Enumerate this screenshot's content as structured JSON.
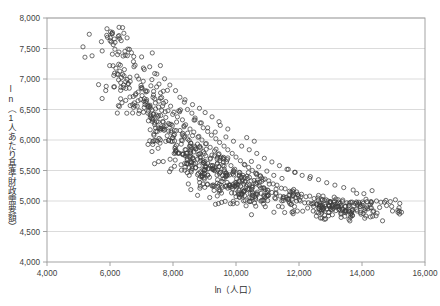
{
  "chart_data": {
    "type": "scatter",
    "title": "",
    "subtitle": "",
    "xlabel": "ln（人口）",
    "ylabel": "ln（1人あたり基準財政需要額）",
    "xlim": [
      4000,
      16000
    ],
    "ylim": [
      4000,
      8000
    ],
    "xticks": [
      4000,
      6000,
      8000,
      10000,
      12000,
      14000,
      16000
    ],
    "yticks": [
      4000,
      4500,
      5000,
      5500,
      6000,
      6500,
      7000,
      7500,
      8000
    ],
    "xtick_labels": [
      "4,000",
      "6,000",
      "8,000",
      "10,000",
      "12,000",
      "14,000",
      "16,000"
    ],
    "ytick_labels": [
      "4,000",
      "4,500",
      "5,000",
      "5,500",
      "6,000",
      "6,500",
      "7,000",
      "7,500",
      "8,000"
    ],
    "grid": "horizontal",
    "legend": "none",
    "marker": {
      "shape": "circle-open",
      "size_px": 4.2,
      "stroke": "#3d3d3d",
      "stroke_width": 0.75,
      "fill": "none"
    },
    "frame_color": "#9a9a9a",
    "grid_color": "#d7d7d7",
    "background": "#ffffff",
    "point_count": 912,
    "relationship": "negative, convex (steep decline then flattening)",
    "annotations": [],
    "points": [
      [
        5430,
        7380
      ],
      [
        6070,
        7740
      ],
      [
        6440,
        7750
      ],
      [
        6240,
        7400
      ],
      [
        5990,
        7220
      ],
      [
        6340,
        6940
      ],
      [
        5880,
        6880
      ],
      [
        6120,
        6870
      ],
      [
        6430,
        6900
      ],
      [
        6640,
        6960
      ],
      [
        5750,
        6680
      ],
      [
        6380,
        6610
      ],
      [
        6720,
        6580
      ],
      [
        6910,
        7000
      ],
      [
        7060,
        7180
      ],
      [
        7260,
        7200
      ],
      [
        7010,
        6860
      ],
      [
        7180,
        6800
      ],
      [
        6820,
        6760
      ],
      [
        7420,
        7090
      ],
      [
        7600,
        7220
      ],
      [
        7330,
        6990
      ],
      [
        7480,
        6870
      ],
      [
        7690,
        6800
      ],
      [
        7120,
        6620
      ],
      [
        7270,
        6570
      ],
      [
        7540,
        6540
      ],
      [
        7770,
        6630
      ],
      [
        7900,
        6900
      ],
      [
        8080,
        6810
      ],
      [
        7840,
        6480
      ],
      [
        7990,
        6420
      ],
      [
        8220,
        6700
      ],
      [
        8360,
        6620
      ],
      [
        8140,
        6380
      ],
      [
        8300,
        6330
      ],
      [
        8460,
        6500
      ],
      [
        8600,
        6440
      ],
      [
        8400,
        6250
      ],
      [
        8540,
        6180
      ],
      [
        8700,
        6330
      ],
      [
        8860,
        6280
      ],
      [
        8660,
        6130
      ],
      [
        8820,
        6060
      ],
      [
        8960,
        6200
      ],
      [
        9100,
        6140
      ],
      [
        8920,
        6000
      ],
      [
        9060,
        5940
      ],
      [
        9220,
        6080
      ],
      [
        9360,
        6020
      ],
      [
        9180,
        5880
      ],
      [
        9320,
        5820
      ],
      [
        9480,
        5960
      ],
      [
        9620,
        5900
      ],
      [
        9440,
        5760
      ],
      [
        9580,
        5700
      ],
      [
        9740,
        5840
      ],
      [
        9880,
        5780
      ],
      [
        9700,
        5640
      ],
      [
        9840,
        5580
      ],
      [
        10000,
        5720
      ],
      [
        10140,
        5660
      ],
      [
        9960,
        5520
      ],
      [
        10100,
        5470
      ],
      [
        10260,
        5600
      ],
      [
        10400,
        5550
      ],
      [
        10220,
        5420
      ],
      [
        10360,
        5370
      ],
      [
        10520,
        5500
      ],
      [
        10660,
        5450
      ],
      [
        10480,
        5330
      ],
      [
        10620,
        5290
      ],
      [
        10780,
        5410
      ],
      [
        10920,
        5360
      ],
      [
        10740,
        5250
      ],
      [
        10880,
        5210
      ],
      [
        11040,
        5330
      ],
      [
        11180,
        5280
      ],
      [
        11000,
        5180
      ],
      [
        11140,
        5140
      ],
      [
        11300,
        5260
      ],
      [
        11440,
        5210
      ],
      [
        11260,
        5120
      ],
      [
        11400,
        5080
      ],
      [
        11560,
        5200
      ],
      [
        11700,
        5160
      ],
      [
        11520,
        5070
      ],
      [
        11660,
        5030
      ],
      [
        11820,
        5150
      ],
      [
        11960,
        5110
      ],
      [
        11780,
        5030
      ],
      [
        11920,
        5000
      ],
      [
        12080,
        5110
      ],
      [
        12220,
        5070
      ],
      [
        12040,
        5000
      ],
      [
        12180,
        4970
      ],
      [
        12340,
        5080
      ],
      [
        12480,
        5040
      ],
      [
        12300,
        4970
      ],
      [
        12440,
        4950
      ],
      [
        12600,
        5050
      ],
      [
        12740,
        5010
      ],
      [
        12560,
        4950
      ],
      [
        12700,
        4930
      ],
      [
        12860,
        5020
      ],
      [
        13000,
        4990
      ],
      [
        12820,
        4940
      ],
      [
        12960,
        4920
      ],
      [
        13120,
        5000
      ],
      [
        13260,
        4980
      ],
      [
        13080,
        4930
      ],
      [
        13220,
        4910
      ],
      [
        13380,
        4990
      ],
      [
        13520,
        4970
      ],
      [
        13340,
        4930
      ],
      [
        13480,
        4910
      ],
      [
        13640,
        4980
      ],
      [
        13780,
        4960
      ],
      [
        13600,
        4930
      ],
      [
        13740,
        4920
      ],
      [
        13900,
        4980
      ],
      [
        14040,
        4960
      ],
      [
        13860,
        4940
      ],
      [
        14000,
        4930
      ],
      [
        14160,
        4990
      ],
      [
        14300,
        4970
      ],
      [
        14460,
        5000
      ],
      [
        14600,
        4980
      ],
      [
        14760,
        5010
      ],
      [
        14900,
        4990
      ],
      [
        15060,
        5020
      ],
      [
        15200,
        4960
      ],
      [
        14320,
        5170
      ],
      [
        14060,
        5120
      ],
      [
        13720,
        5180
      ],
      [
        13420,
        5220
      ],
      [
        13140,
        5260
      ],
      [
        12880,
        5300
      ],
      [
        12620,
        5350
      ],
      [
        12360,
        5400
      ],
      [
        9020,
        6450
      ],
      [
        9240,
        6380
      ],
      [
        9460,
        6300
      ],
      [
        8840,
        6520
      ],
      [
        8620,
        6580
      ],
      [
        8380,
        6660
      ],
      [
        10180,
        5900
      ],
      [
        10420,
        5840
      ],
      [
        10660,
        5780
      ],
      [
        9920,
        5980
      ],
      [
        9680,
        6050
      ],
      [
        10900,
        5700
      ],
      [
        11140,
        5640
      ],
      [
        11380,
        5580
      ],
      [
        11620,
        5520
      ],
      [
        11860,
        5470
      ],
      [
        10340,
        6040
      ],
      [
        10580,
        5980
      ],
      [
        9740,
        6180
      ],
      [
        9500,
        6240
      ],
      [
        11200,
        5420
      ],
      [
        11460,
        5370
      ],
      [
        10980,
        5490
      ],
      [
        10720,
        5560
      ],
      [
        9100,
        6200
      ],
      [
        9340,
        6130
      ],
      [
        8900,
        6280
      ],
      [
        8700,
        6360
      ],
      [
        12100,
        5420
      ],
      [
        12340,
        5370
      ],
      [
        11880,
        5470
      ],
      [
        11660,
        5520
      ]
    ]
  }
}
